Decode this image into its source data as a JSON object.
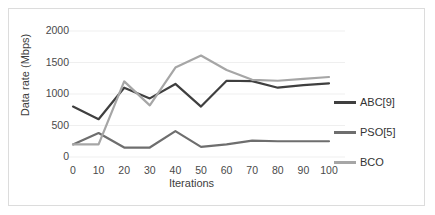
{
  "chart_data": {
    "type": "line",
    "title": "",
    "xlabel": "Iterations",
    "ylabel": "Data rate (Mbps)",
    "x": [
      0,
      10,
      20,
      30,
      40,
      50,
      60,
      70,
      80,
      90,
      100
    ],
    "xticklabels": [
      "0",
      "10",
      "20",
      "30",
      "40",
      "50",
      "60",
      "70",
      "80",
      "90",
      "100"
    ],
    "yticklabels": [
      "0",
      "500",
      "1000",
      "1500",
      "2000"
    ],
    "yticks": [
      0,
      500,
      1000,
      1500,
      2000
    ],
    "xlim": [
      0,
      100
    ],
    "ylim": [
      0,
      2000
    ],
    "grid": "horizontal",
    "legend_position": "right",
    "series": [
      {
        "name": "ABC[9]",
        "color": "#3f3f3f",
        "values": [
          800,
          600,
          1100,
          930,
          1160,
          800,
          1210,
          1205,
          1100,
          1140,
          1170
        ]
      },
      {
        "name": "PSO[5]",
        "color": "#6e6e6e",
        "values": [
          200,
          380,
          150,
          150,
          410,
          160,
          200,
          260,
          250,
          250,
          250
        ]
      },
      {
        "name": "BCO",
        "color": "#a6a6a6",
        "values": [
          200,
          200,
          1200,
          820,
          1420,
          1610,
          1380,
          1225,
          1210,
          1240,
          1270
        ]
      }
    ]
  },
  "legend": {
    "items": [
      {
        "label": "ABC[9]",
        "color": "#3f3f3f"
      },
      {
        "label": "PSO[5]",
        "color": "#6e6e6e"
      },
      {
        "label": "BCO",
        "color": "#a6a6a6"
      }
    ]
  },
  "colors": {
    "border": "#dcdcdc",
    "gridline": "#efefef",
    "tick_text": "#4a4a4a",
    "axis_title": "#404040",
    "background": "#ffffff"
  }
}
